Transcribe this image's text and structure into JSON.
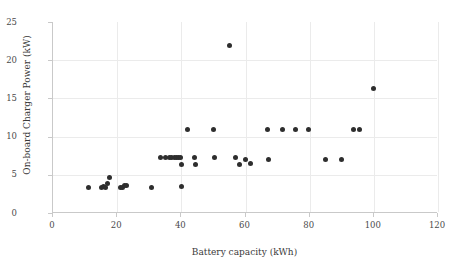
{
  "chart_data": {
    "type": "scatter",
    "title": "",
    "xlabel": "Battery capacity (kWh)",
    "ylabel": "On-board Charger Power (kW)",
    "xlim": [
      0,
      120
    ],
    "ylim": [
      0,
      25
    ],
    "xticks": [
      0,
      20,
      40,
      60,
      80,
      100,
      120
    ],
    "yticks": [
      0,
      5,
      10,
      15,
      20,
      25
    ],
    "xtick_labels": [
      "0",
      "20",
      "40",
      "60",
      "80",
      "100",
      "120"
    ],
    "ytick_labels": [
      "0",
      "5",
      "10",
      "15",
      "20",
      "25"
    ],
    "grid": "both-major",
    "legend": "none",
    "marker_color": "#2e2e2e",
    "gridline_color": "#ebebeb",
    "axis_color": "#c9c9c9",
    "series": [
      {
        "name": "vehicles",
        "points": [
          [
            11.0,
            3.3
          ],
          [
            15.0,
            3.3
          ],
          [
            15.8,
            3.5
          ],
          [
            16.4,
            3.4
          ],
          [
            17.1,
            3.8
          ],
          [
            17.6,
            4.6
          ],
          [
            21.0,
            3.3
          ],
          [
            21.7,
            3.4
          ],
          [
            22.4,
            3.6
          ],
          [
            23.0,
            3.6
          ],
          [
            30.8,
            3.3
          ],
          [
            33.5,
            7.2
          ],
          [
            35.0,
            7.2
          ],
          [
            36.2,
            7.2
          ],
          [
            37.0,
            7.2
          ],
          [
            37.8,
            7.2
          ],
          [
            38.5,
            7.2
          ],
          [
            39.2,
            7.2
          ],
          [
            39.8,
            7.2
          ],
          [
            40.0,
            6.4
          ],
          [
            40.2,
            3.5
          ],
          [
            42.0,
            10.9
          ],
          [
            44.0,
            7.2
          ],
          [
            44.5,
            6.4
          ],
          [
            50.0,
            10.9
          ],
          [
            50.2,
            7.2
          ],
          [
            55.0,
            21.9
          ],
          [
            57.0,
            7.2
          ],
          [
            58.0,
            6.4
          ],
          [
            60.0,
            7.0
          ],
          [
            61.5,
            6.5
          ],
          [
            67.0,
            10.9
          ],
          [
            67.2,
            7.0
          ],
          [
            71.5,
            10.9
          ],
          [
            75.5,
            10.9
          ],
          [
            79.5,
            10.9
          ],
          [
            85.0,
            7.0
          ],
          [
            90.0,
            7.0
          ],
          [
            93.8,
            10.9
          ],
          [
            95.5,
            10.9
          ],
          [
            100.0,
            16.3
          ]
        ]
      }
    ]
  }
}
